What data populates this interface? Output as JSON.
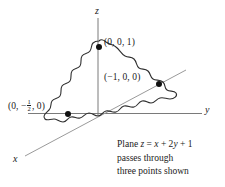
{
  "figure": {
    "kind": "3d-coordinate-plane-sketch",
    "axes": {
      "z_label": "z",
      "y_label": "y",
      "x_label": "x"
    },
    "points": [
      {
        "label": "(0, 0, 1)",
        "coords": [
          0,
          0,
          1
        ]
      },
      {
        "label": "(−1, 0, 0)",
        "coords": [
          -1,
          0,
          0
        ]
      },
      {
        "label_prefix": "(0, −",
        "fraction_num": "1",
        "fraction_den": "2",
        "label_suffix": ", 0)",
        "coords": [
          0,
          -0.5,
          0
        ]
      }
    ],
    "caption": {
      "line1_prefix": "Plane ",
      "line1_var_z": "z",
      "line1_mid": " = ",
      "line1_var_x": "x",
      "line1_plus": " + 2",
      "line1_var_y": "y",
      "line1_end": " + 1",
      "line2": "passes through",
      "line3": "three points shown"
    },
    "colors": {
      "ink": "#1a1a1a",
      "axis": "#6f6f6f",
      "outline": "#2b2b2b",
      "background": "#ffffff"
    }
  }
}
